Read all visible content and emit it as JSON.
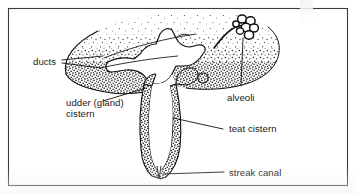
{
  "figure": {
    "border_color": "#3a3a3a",
    "background_color": "#ffffff",
    "ink_color": "#111111",
    "stipple_color": "#1c1c1c",
    "cavity_color": "#ffffff"
  },
  "labels": {
    "ducts": "ducts",
    "udder_cistern_line1": "udder (gland)",
    "udder_cistern_line2": "cistern",
    "alveoli": "alveoli",
    "teat_cistern": "teat cistern",
    "streak_canal": "streak canal"
  },
  "structures": [
    {
      "name": "ducts",
      "label": "ducts",
      "side": "left"
    },
    {
      "name": "udder-gland-cistern",
      "label": "udder (gland) cistern",
      "side": "left"
    },
    {
      "name": "alveoli",
      "label": "alveoli",
      "side": "right"
    },
    {
      "name": "teat-cistern",
      "label": "teat cistern",
      "side": "right"
    },
    {
      "name": "streak-canal",
      "label": "streak canal",
      "side": "right"
    }
  ]
}
